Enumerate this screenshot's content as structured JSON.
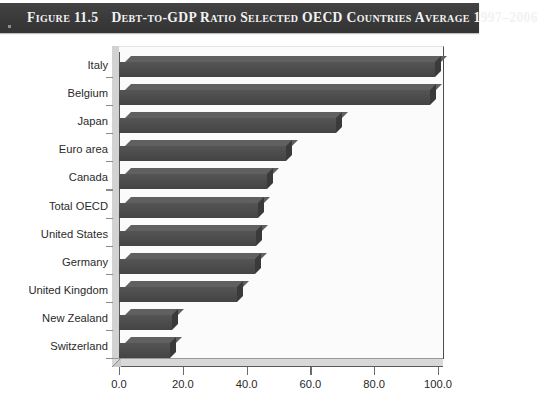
{
  "title": {
    "figure_label": "Figure 11.5",
    "main": "Debt-to-GDP Ratio Selected OECD Countries Average 1997–2006"
  },
  "chart_data": {
    "type": "bar",
    "orientation": "horizontal",
    "title": "Debt-to-GDP Ratio Selected OECD Countries Average 1997–2006",
    "xlabel": "",
    "ylabel": "",
    "xlim": [
      0,
      100
    ],
    "xticks": [
      "0.0",
      "20.0",
      "40.0",
      "60.0",
      "80.0",
      "100.0"
    ],
    "xtick_values": [
      0,
      20,
      40,
      60,
      80,
      100
    ],
    "grid": false,
    "legend": "none",
    "categories": [
      "Italy",
      "Belgium",
      "Japan",
      "Euro area",
      "Canada",
      "Total OECD",
      "United States",
      "Germany",
      "United Kingdom",
      "New Zealand",
      "Switzerland"
    ],
    "values": [
      99.0,
      97.5,
      68.0,
      52.5,
      46.5,
      43.5,
      43.0,
      42.5,
      37.0,
      16.5,
      16.0
    ],
    "bar_color": "#4b4b4b",
    "plot_background": "#fbfbfb"
  },
  "colors": {
    "title_band": "#3a3a3a",
    "title_text": "#f2f2f2",
    "bar": "#4b4b4b",
    "bar_top": "#606060",
    "bar_side": "#3a3a3a",
    "axis": "#5a5a5a",
    "wall": "#d2d2d2",
    "floor": "#d8d8d8"
  }
}
